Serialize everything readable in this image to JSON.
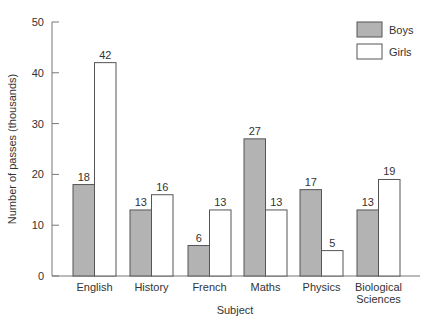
{
  "chart_data": {
    "type": "bar",
    "title": "",
    "xlabel": "Subject",
    "ylabel": "Number of passes (thousands)",
    "ylim": [
      0,
      50
    ],
    "yticks": [
      0,
      10,
      20,
      30,
      40,
      50
    ],
    "grid": false,
    "legend_position": "top-right",
    "categories": [
      "English",
      "History",
      "French",
      "Maths",
      "Physics",
      "Biological Sciences"
    ],
    "category_lines": [
      [
        "English"
      ],
      [
        "History"
      ],
      [
        "French"
      ],
      [
        "Maths"
      ],
      [
        "Physics"
      ],
      [
        "Biological",
        "Sciences"
      ]
    ],
    "series": [
      {
        "name": "Boys",
        "values": [
          18,
          13,
          6,
          27,
          17,
          13
        ],
        "color": "#b3b3b3"
      },
      {
        "name": "Girls",
        "values": [
          42,
          16,
          13,
          13,
          5,
          19
        ],
        "color": "#ffffff"
      }
    ]
  },
  "colors": {
    "axis": "#777777",
    "bar_stroke": "#555555",
    "text": "#333333"
  }
}
